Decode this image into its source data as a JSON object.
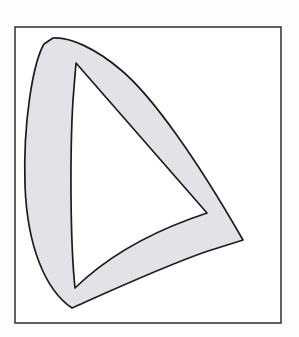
{
  "figure": {
    "domain": "diagram",
    "title": "",
    "caption": "",
    "background_color": "#fdfdfd",
    "frame": {
      "name": "rectangular-border",
      "x": 15,
      "y": 27,
      "width": 266,
      "height": 296,
      "stroke_color": "#3a3a3a",
      "stroke_width": 1.6,
      "fill_color": "#ffffff"
    },
    "shape": {
      "name": "curved-triangular-ring",
      "description": "closed ring band: rounded crescent on the left, straight edges on the upper-right and lower-right, enclosing a white triangular hole",
      "fill_color": "#e3e3e7",
      "stroke_color": "#1c1c1c",
      "stroke_width": 1.7,
      "hole_fill_color": "#ffffff",
      "outer_path": "M 53 38 C 70 37 95 48 121 70 C 152 96 196 158 243 240 L 205 252 C 160 268 110 291 72 308 C 45 290 27 245 25 185 C 23 122 33 63 44 44 Z",
      "inner_path": "M 76 63 L 207 213 L 190 219 C 152 233 110 254 75 288 C 70 240 70 150 73 100 Z",
      "outer_vertices": [
        {
          "name": "apex-top",
          "x": 53,
          "y": 38
        },
        {
          "name": "right-point",
          "x": 243,
          "y": 240
        },
        {
          "name": "bottom-point",
          "x": 72,
          "y": 308
        },
        {
          "name": "left-bulge",
          "x": 25,
          "y": 185
        }
      ],
      "inner_vertices": [
        {
          "name": "hole-top",
          "x": 76,
          "y": 63
        },
        {
          "name": "hole-right",
          "x": 207,
          "y": 213
        },
        {
          "name": "hole-bottom",
          "x": 75,
          "y": 288
        }
      ]
    }
  }
}
